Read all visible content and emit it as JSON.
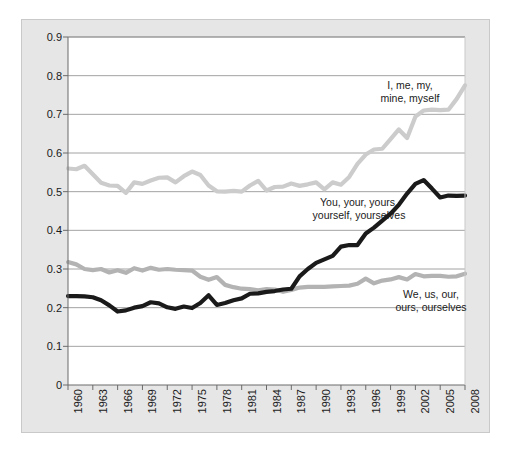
{
  "chart_data": {
    "type": "line",
    "title": "",
    "subtitle": "",
    "xlabel": "",
    "ylabel": "",
    "xlim": [
      1960,
      2008
    ],
    "ylim": [
      0,
      0.9
    ],
    "grid": true,
    "legend_position": "inline-annotations",
    "ytick_labels": [
      "0.9",
      "0.8",
      "0.7",
      "0.6",
      "0.5",
      "0.4",
      "0.3",
      "0.2",
      "0.1",
      "0"
    ],
    "ytick_values": [
      0.9,
      0.8,
      0.7,
      0.6,
      0.5,
      0.4,
      0.3,
      0.2,
      0.1,
      0
    ],
    "xtick_labels": [
      "1960",
      "1963",
      "1966",
      "1969",
      "1972",
      "1975",
      "1978",
      "1981",
      "1984",
      "1987",
      "1990",
      "1993",
      "1996",
      "1999",
      "2002",
      "2005",
      "2008"
    ],
    "xtick_values": [
      1960,
      1963,
      1966,
      1969,
      1972,
      1975,
      1978,
      1981,
      1984,
      1987,
      1990,
      1993,
      1996,
      1999,
      2002,
      2005,
      2008
    ],
    "x": [
      1960,
      1961,
      1962,
      1963,
      1964,
      1965,
      1966,
      1967,
      1968,
      1969,
      1970,
      1971,
      1972,
      1973,
      1974,
      1975,
      1976,
      1977,
      1978,
      1979,
      1980,
      1981,
      1982,
      1983,
      1984,
      1985,
      1986,
      1987,
      1988,
      1989,
      1990,
      1991,
      1992,
      1993,
      1994,
      1995,
      1996,
      1997,
      1998,
      1999,
      2000,
      2001,
      2002,
      2003,
      2004,
      2005,
      2006,
      2007,
      2008
    ],
    "series": [
      {
        "name": "I, me, my, mine, myself",
        "color": "#cccccc",
        "annotation": "I, me, my,\nmine, myself",
        "values": [
          0.56,
          0.558,
          0.567,
          0.545,
          0.523,
          0.516,
          0.515,
          0.497,
          0.524,
          0.52,
          0.529,
          0.536,
          0.537,
          0.524,
          0.54,
          0.552,
          0.543,
          0.516,
          0.501,
          0.5,
          0.502,
          0.5,
          0.516,
          0.528,
          0.503,
          0.512,
          0.513,
          0.521,
          0.515,
          0.519,
          0.524,
          0.506,
          0.524,
          0.518,
          0.538,
          0.572,
          0.596,
          0.609,
          0.611,
          0.636,
          0.661,
          0.639,
          0.694,
          0.71,
          0.712,
          0.711,
          0.712,
          0.74,
          0.775
        ]
      },
      {
        "name": "You, your, yours, yourself, yourselves",
        "color": "#1a1a1a",
        "annotation": "You, your, yours,\nyourself, yourselves",
        "values": [
          0.23,
          0.23,
          0.229,
          0.227,
          0.219,
          0.206,
          0.19,
          0.193,
          0.2,
          0.204,
          0.214,
          0.211,
          0.201,
          0.197,
          0.203,
          0.199,
          0.212,
          0.232,
          0.207,
          0.212,
          0.219,
          0.224,
          0.236,
          0.237,
          0.241,
          0.243,
          0.247,
          0.249,
          0.281,
          0.3,
          0.316,
          0.325,
          0.334,
          0.358,
          0.362,
          0.362,
          0.392,
          0.407,
          0.425,
          0.443,
          0.466,
          0.495,
          0.52,
          0.53,
          0.508,
          0.485,
          0.49,
          0.489,
          0.49
        ]
      },
      {
        "name": "We, us, our, ours, ourselves",
        "color": "#b3b3b3",
        "annotation": "We, us, our,\nours, ourselves",
        "values": [
          0.318,
          0.312,
          0.3,
          0.297,
          0.3,
          0.291,
          0.297,
          0.29,
          0.302,
          0.296,
          0.303,
          0.298,
          0.3,
          0.298,
          0.297,
          0.296,
          0.28,
          0.272,
          0.279,
          0.259,
          0.253,
          0.249,
          0.248,
          0.245,
          0.248,
          0.247,
          0.241,
          0.246,
          0.252,
          0.254,
          0.254,
          0.254,
          0.255,
          0.256,
          0.257,
          0.262,
          0.275,
          0.263,
          0.27,
          0.273,
          0.279,
          0.273,
          0.287,
          0.281,
          0.282,
          0.282,
          0.28,
          0.281,
          0.288
        ]
      }
    ]
  }
}
